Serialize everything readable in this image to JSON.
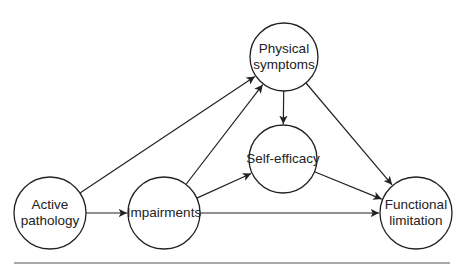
{
  "diagram": {
    "type": "path-diagram",
    "nodes": [
      {
        "id": "active_pathology",
        "lines": [
          "Active",
          "pathology"
        ],
        "cx": 50,
        "cy": 213,
        "r": 36
      },
      {
        "id": "impairments",
        "lines": [
          "Impairments"
        ],
        "cx": 164,
        "cy": 213,
        "r": 36
      },
      {
        "id": "physical_symptoms",
        "lines": [
          "Physical",
          "symptoms"
        ],
        "cx": 284,
        "cy": 57,
        "r": 34
      },
      {
        "id": "self_efficacy",
        "lines": [
          "Self-efficacy"
        ],
        "cx": 283,
        "cy": 159,
        "r": 34
      },
      {
        "id": "functional_limitation",
        "lines": [
          "Functional",
          "limitation"
        ],
        "cx": 416,
        "cy": 213,
        "r": 36
      }
    ],
    "edges": [
      {
        "from": "active_pathology",
        "to": "physical_symptoms"
      },
      {
        "from": "active_pathology",
        "to": "impairments"
      },
      {
        "from": "impairments",
        "to": "physical_symptoms"
      },
      {
        "from": "impairments",
        "to": "self_efficacy"
      },
      {
        "from": "impairments",
        "to": "functional_limitation"
      },
      {
        "from": "physical_symptoms",
        "to": "self_efficacy"
      },
      {
        "from": "physical_symptoms",
        "to": "functional_limitation"
      },
      {
        "from": "self_efficacy",
        "to": "functional_limitation"
      }
    ],
    "bottom_rule": {
      "x1": 14,
      "x2": 450,
      "y": 263
    },
    "colors": {
      "stroke": "#222222",
      "text": "#222222",
      "background": "#ffffff",
      "rule": "#555555"
    }
  }
}
